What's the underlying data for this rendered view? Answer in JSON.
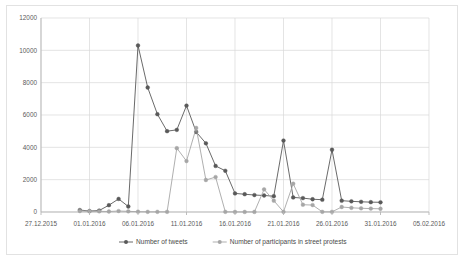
{
  "chart_data": {
    "type": "line",
    "title": "",
    "xlabel": "",
    "ylabel": "",
    "ylim": [
      0,
      12000
    ],
    "ytick_values": [
      0,
      2000,
      4000,
      6000,
      8000,
      10000,
      12000
    ],
    "ytick_labels": [
      "0",
      "2000",
      "4000",
      "6000",
      "8000",
      "10000",
      "12000"
    ],
    "xtick_labels": [
      "27.12.2015",
      "01.01.2016",
      "06.01.2016",
      "11.01.2016",
      "16.01.2016",
      "21.01.2016",
      "26.01.2016",
      "31.01.2016",
      "05.02.2016"
    ],
    "xtick_positions": [
      0,
      5,
      10,
      15,
      20,
      25,
      30,
      35,
      40
    ],
    "xlim": [
      0,
      40
    ],
    "grid": "both",
    "legend_position": "bottom",
    "x": [
      4,
      5,
      6,
      7,
      8,
      9,
      10,
      11,
      12,
      13,
      14,
      15,
      16,
      17,
      18,
      19,
      20,
      21,
      22,
      23,
      24,
      25,
      26,
      27,
      28,
      29,
      30,
      31,
      32,
      33,
      34,
      35
    ],
    "x_dates": [
      "31.12.2015",
      "01.01.2016",
      "02.01.2016",
      "03.01.2016",
      "04.01.2016",
      "05.01.2016",
      "06.01.2016",
      "07.01.2016",
      "08.01.2016",
      "09.01.2016",
      "10.01.2016",
      "11.01.2016",
      "12.01.2016",
      "13.01.2016",
      "14.01.2016",
      "15.01.2016",
      "16.01.2016",
      "17.01.2016",
      "18.01.2016",
      "19.01.2016",
      "20.01.2016",
      "21.01.2016",
      "22.01.2016",
      "23.01.2016",
      "24.01.2016",
      "25.01.2016",
      "26.01.2016",
      "27.01.2016",
      "28.01.2016",
      "29.01.2016",
      "30.01.2016",
      "31.01.2016"
    ],
    "series": [
      {
        "name": "Number of tweets",
        "color": "#595959",
        "marker": "circle",
        "values": [
          120,
          60,
          90,
          420,
          810,
          340,
          10300,
          7700,
          6050,
          5000,
          5080,
          6580,
          4950,
          4250,
          2850,
          2550,
          1150,
          1100,
          1050,
          1020,
          980,
          4420,
          900,
          860,
          790,
          760,
          3850,
          700,
          660,
          630,
          610,
          600
        ]
      },
      {
        "name": "Number of participants in street protests",
        "color": "#a6a6a6",
        "marker": "circle",
        "values": [
          60,
          50,
          40,
          30,
          60,
          40,
          20,
          10,
          10,
          10,
          3950,
          3150,
          5200,
          1980,
          2160,
          10,
          5,
          5,
          5,
          1400,
          700,
          10,
          1750,
          450,
          430,
          10,
          10,
          310,
          260,
          230,
          210,
          200
        ]
      }
    ]
  },
  "legend": {
    "items": [
      {
        "label": "Number of tweets",
        "color": "#595959"
      },
      {
        "label": "Number of participants in street protests",
        "color": "#a6a6a6"
      }
    ]
  }
}
